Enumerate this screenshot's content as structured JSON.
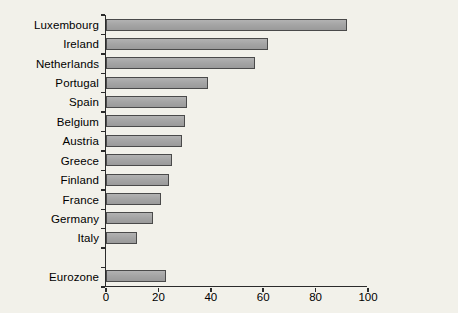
{
  "chart_data": {
    "type": "bar",
    "orientation": "horizontal",
    "title": "",
    "xlabel": "",
    "ylabel": "",
    "categories": [
      "Luxembourg",
      "Ireland",
      "Netherlands",
      "Portugal",
      "Spain",
      "Belgium",
      "Austria",
      "Greece",
      "Finland",
      "France",
      "Germany",
      "Italy",
      "",
      "Eurozone"
    ],
    "values": [
      92,
      62,
      57,
      39,
      31,
      30,
      29,
      25,
      24,
      21,
      18,
      12,
      null,
      23
    ],
    "xlim": [
      0,
      100
    ],
    "xticks": [
      0,
      20,
      40,
      60,
      80,
      100
    ],
    "grid": false,
    "legend": null,
    "colors": {
      "background": "#f2f1ea",
      "bar_fill": "#a4a4a4",
      "bar_border": "#4a4a4a",
      "axis": "#2b2b2b",
      "text": "#000000"
    }
  }
}
